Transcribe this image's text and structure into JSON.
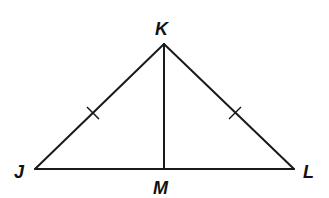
{
  "diagram": {
    "type": "isosceles-triangle-with-median",
    "colors": {
      "stroke": "#1a1a1a",
      "label": "#111111",
      "background": "#ffffff"
    },
    "vertices": {
      "K": {
        "label": "K",
        "x": 164,
        "y": 44
      },
      "J": {
        "label": "J",
        "x": 35,
        "y": 169
      },
      "L": {
        "label": "L",
        "x": 294,
        "y": 169
      },
      "M": {
        "label": "M",
        "x": 164,
        "y": 169
      }
    },
    "segments": [
      {
        "name": "JK",
        "from": "J",
        "to": "K",
        "tick_marks": 1
      },
      {
        "name": "KL",
        "from": "K",
        "to": "L",
        "tick_marks": 1
      },
      {
        "name": "JL",
        "from": "J",
        "to": "L",
        "tick_marks": 0
      },
      {
        "name": "KM",
        "from": "K",
        "to": "M",
        "tick_marks": 0
      }
    ],
    "labels": {
      "K": "K",
      "J": "J",
      "L": "L",
      "M": "M"
    }
  }
}
